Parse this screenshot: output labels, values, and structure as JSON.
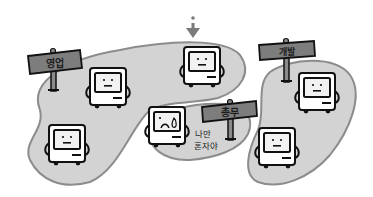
{
  "illustration": {
    "colors": {
      "background": "#ffffff",
      "blob_fill": "#d3d3d3",
      "blob_stroke": "#8c8c8c",
      "sign_fill": "#7d7d7d",
      "sign_text": "#1e1e1e",
      "computer_body": "#ffffff",
      "outline": "#111111",
      "arrow": "#7a7a7a"
    },
    "groups": [
      {
        "id": "sales",
        "sign_label": "영업"
      },
      {
        "id": "development",
        "sign_label": "개발"
      },
      {
        "id": "general-affairs",
        "sign_label": "총무"
      }
    ],
    "lonely_caption": {
      "line1": "나만",
      "line2": "혼자야"
    },
    "pointer": {
      "icon": "down-arrow-icon"
    }
  }
}
